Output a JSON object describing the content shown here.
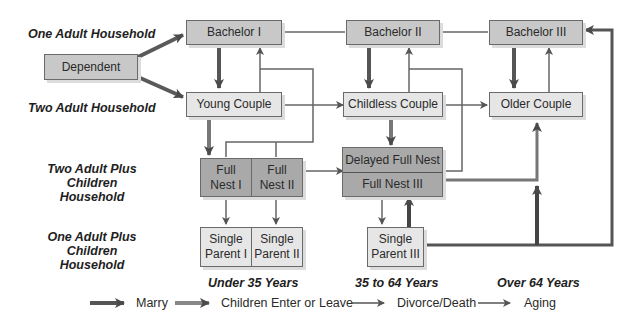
{
  "lanes": {
    "one_adult": "One Adult Household",
    "two_adult": "Two Adult Household",
    "two_adult_children_1": "Two Adult Plus",
    "two_adult_children_2": "Children Household",
    "one_adult_children_1": "One Adult Plus",
    "one_adult_children_2": "Children Household"
  },
  "nodes": {
    "dependent": "Dependent",
    "bachelor1": "Bachelor I",
    "bachelor2": "Bachelor II",
    "bachelor3": "Bachelor III",
    "young_couple": "Young Couple",
    "childless_couple": "Childless Couple",
    "older_couple": "Older Couple",
    "full_nest1_a": "Full",
    "full_nest1_b": "Nest I",
    "full_nest2_a": "Full",
    "full_nest2_b": "Nest II",
    "delayed_full_nest": "Delayed Full Nest",
    "full_nest3": "Full Nest III",
    "single_parent1_a": "Single",
    "single_parent1_b": "Parent I",
    "single_parent2_a": "Single",
    "single_parent2_b": "Parent II",
    "single_parent3_a": "Single",
    "single_parent3_b": "Parent III"
  },
  "ages": {
    "under35": "Under 35 Years",
    "mid": "35 to 64 Years",
    "over64": "Over 64 Years"
  },
  "legend": {
    "marry": "Marry",
    "children": "Children Enter or Leave",
    "divorce": "Divorce/Death",
    "aging": "Aging"
  },
  "colors": {
    "marry": "#555555",
    "children": "#7a7a7a",
    "line": "#6a6a6a"
  }
}
